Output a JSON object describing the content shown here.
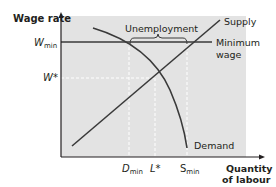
{
  "diagram": {
    "type": "minimum-wage-labour-market",
    "y_axis_label": "Wage rate",
    "x_axis_label_line1": "Quantity",
    "x_axis_label_line2": "of labour",
    "y_ticks": {
      "w_min_main": "W",
      "w_min_sub": "min",
      "w_star": "W*"
    },
    "x_ticks": {
      "d_min_main": "D",
      "d_min_sub": "min",
      "l_star": "L*",
      "s_min_main": "S",
      "s_min_sub": "min"
    },
    "curves": {
      "supply_label": "Supply",
      "demand_label": "Demand",
      "min_wage_label_line1": "Minimum",
      "min_wage_label_line2": "wage"
    },
    "annotation": {
      "unemployment_label": "Unemployment"
    },
    "colors": {
      "panel": "#e3e3e3",
      "line": "#3a3a3a",
      "dashed": "#ffffff",
      "text": "#231f20"
    }
  }
}
